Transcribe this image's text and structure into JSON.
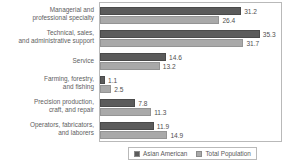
{
  "chart_data": {
    "type": "bar",
    "orientation": "horizontal",
    "title": "",
    "subtitle": "",
    "xlabel": "",
    "ylabel": "",
    "xlim": [
      0,
      40
    ],
    "grid": false,
    "legend_position": "bottom",
    "categories": [
      "Managerial and\nprofessional specialty",
      "Technical, sales,\nand administrative support",
      "Service",
      "Farming, forestry,\nand fishing",
      "Precision production,\ncraft, and repair",
      "Operators, fabricators,\nand laborers"
    ],
    "category_lines": [
      [
        "Managerial and",
        "professional specialty"
      ],
      [
        "Technical, sales,",
        "and administrative support"
      ],
      [
        "Service"
      ],
      [
        "Farming, forestry,",
        "and fishing"
      ],
      [
        "Precision production,",
        "craft, and repair"
      ],
      [
        "Operators, fabricators,",
        "and laborers"
      ]
    ],
    "series": [
      {
        "name": "Asian American",
        "color": "#5b5b5b",
        "values": [
          31.2,
          35.3,
          14.6,
          1.1,
          7.8,
          11.9
        ],
        "labels": [
          "31.2",
          "35.3",
          "14.6",
          "1.1",
          "7.8",
          "11.9"
        ]
      },
      {
        "name": "Total Population",
        "color": "#a9a9a9",
        "values": [
          26.4,
          31.7,
          13.2,
          2.5,
          11.3,
          14.9
        ],
        "labels": [
          "26.4",
          "31.7",
          "13.2",
          "2.5",
          "11.3",
          "14.9"
        ]
      }
    ]
  },
  "legend": {
    "items": [
      {
        "label": "Asian American",
        "color": "#5b5b5b"
      },
      {
        "label": "Total Population",
        "color": "#a9a9a9"
      }
    ]
  },
  "colors": {
    "series_a": "#5b5b5b",
    "series_b": "#a9a9a9",
    "frame": "#b9b9b9",
    "text": "#5a5a5a",
    "background": "#ffffff"
  }
}
